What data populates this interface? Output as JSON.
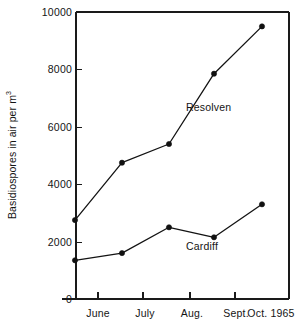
{
  "figure": {
    "background_color": "#ffffff",
    "ink_color": "#131313"
  },
  "chart_data": {
    "type": "line",
    "title": "",
    "xlabel": "",
    "ylabel": "Basidiospores in air per m",
    "ylabel_superscript": "3",
    "categories": [
      "June",
      "July",
      "Aug.",
      "Sept.",
      "Oct. 1965"
    ],
    "ylim": [
      0,
      10000
    ],
    "ytick_labels": [
      "10000",
      "8000",
      "6000",
      "4000",
      "2000",
      "0"
    ],
    "yticks": [
      10000,
      8000,
      6000,
      4000,
      2000,
      0
    ],
    "grid": false,
    "legend_position": "inline-annotation",
    "series": [
      {
        "name": "Resolven",
        "values": [
          2750,
          4750,
          5400,
          7850,
          9500
        ],
        "marker": "filled-circle"
      },
      {
        "name": "Cardiff",
        "values": [
          1350,
          1600,
          2500,
          2150,
          3300
        ],
        "marker": "filled-circle"
      }
    ]
  },
  "annotations": {
    "resolven_label": "Resolven",
    "cardiff_label": "Cardiff"
  }
}
